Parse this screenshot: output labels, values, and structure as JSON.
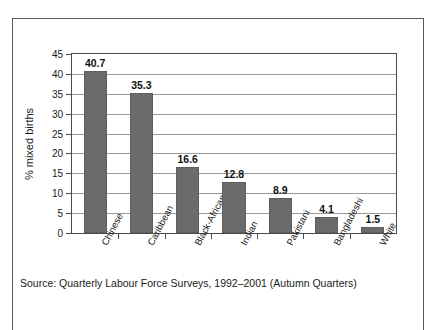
{
  "chart_data": {
    "type": "bar",
    "title": "",
    "subtitle": "",
    "xlabel": "",
    "ylabel": "% mixed births",
    "ylim": [
      0,
      45
    ],
    "ytick_step": 5,
    "yticks": [
      0,
      5,
      10,
      15,
      20,
      25,
      30,
      35,
      40,
      45
    ],
    "ytick_labels": [
      "0",
      "5",
      "10",
      "15",
      "20",
      "25",
      "30",
      "35",
      "40",
      "45"
    ],
    "grid": true,
    "grid_axis": "y",
    "legend": false,
    "legend_position": "none",
    "categories": [
      "Chinese",
      "Caribbean",
      "Black-African",
      "Indian",
      "Pakistani",
      "Bangladeshi",
      "White"
    ],
    "values": [
      40.7,
      35.3,
      16.6,
      12.8,
      8.9,
      4.1,
      1.5
    ],
    "value_labels": [
      "40.7",
      "35.3",
      "16.6",
      "12.8",
      "8.9",
      "4.1",
      "1.5"
    ],
    "bar_color": "#6b6b6b",
    "bar_edge_color": "#5e5e5e",
    "axis_color": "#4a4a4a",
    "grid_color": "#9a9a9a",
    "tick_label_rotation": -62
  },
  "footer": {
    "source": "Source: Quarterly Labour Force Surveys, 1992–2001 (Autumn Quarters)"
  },
  "frame": {
    "border_color": "#5a5a5a",
    "background": "#ffffff"
  }
}
